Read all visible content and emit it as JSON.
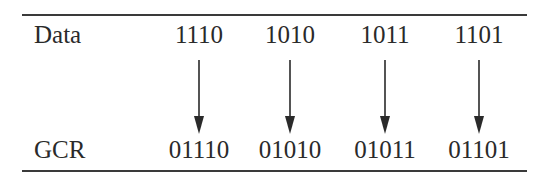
{
  "table": {
    "row_labels": {
      "data": "Data",
      "gcr": "GCR"
    },
    "columns": [
      {
        "data": "1110",
        "gcr": "01110"
      },
      {
        "data": "1010",
        "gcr": "01010"
      },
      {
        "data": "1011",
        "gcr": "01011"
      },
      {
        "data": "1101",
        "gcr": "01101"
      }
    ]
  },
  "colors": {
    "ink": "#2a2a2a",
    "rule": "#3a3a3a"
  }
}
